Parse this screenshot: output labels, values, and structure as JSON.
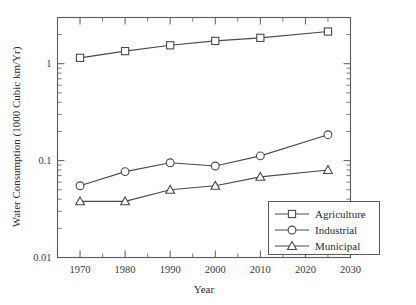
{
  "chart_data": {
    "type": "line",
    "title": "",
    "xlabel": "Year",
    "ylabel": "Water Consumption (1000 Cubic km/Yr)",
    "xlim": [
      1965,
      2030
    ],
    "ylim": [
      0.01,
      3.0
    ],
    "yscale": "log",
    "grid": false,
    "legend_position": "bottom-right",
    "x": [
      1970,
      1980,
      1990,
      2000,
      2010,
      2025
    ],
    "xticks": [
      "1970",
      "1980",
      "1990",
      "2000",
      "2010",
      "2020",
      "2030"
    ],
    "xtick_values": [
      1970,
      1980,
      1990,
      2000,
      2010,
      2020,
      2030
    ],
    "yticks": [
      "0.01",
      "0.1",
      "1"
    ],
    "ytick_values": [
      0.01,
      0.1,
      1
    ],
    "series": [
      {
        "name": "Agriculture",
        "marker": "square",
        "values": [
          1.15,
          1.35,
          1.55,
          1.72,
          1.85,
          2.15
        ]
      },
      {
        "name": "Industrial",
        "marker": "circle",
        "values": [
          0.055,
          0.077,
          0.095,
          0.088,
          0.112,
          0.185
        ]
      },
      {
        "name": "Municipal",
        "marker": "triangle",
        "values": [
          0.038,
          0.038,
          0.05,
          0.055,
          0.068,
          0.08
        ]
      }
    ],
    "colors": {
      "line": "#4a4a4a",
      "axis": "#5a5a5a",
      "marker_fill": "#ffffff",
      "background": "#ffffff"
    }
  },
  "legend": {
    "items": [
      {
        "label": "Agriculture",
        "marker": "square"
      },
      {
        "label": "Industrial",
        "marker": "circle"
      },
      {
        "label": "Municipal",
        "marker": "triangle"
      }
    ]
  }
}
